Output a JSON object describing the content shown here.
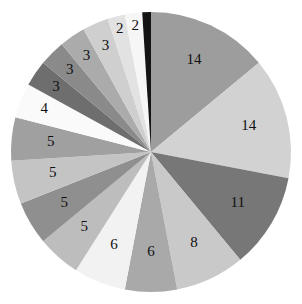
{
  "chart_data": {
    "type": "pie",
    "title": "",
    "subtitle": "",
    "xlabel": "",
    "ylabel": "",
    "legend": "none",
    "grid": false,
    "total": 100,
    "start_angle_deg": 0,
    "direction": "clockwise",
    "labels_shown_as": "value",
    "categories": [
      "14",
      "14",
      "11",
      "8",
      "6",
      "6",
      "5",
      "5",
      "5",
      "5",
      "4",
      "3",
      "3",
      "3",
      "3",
      "2",
      "2",
      "1"
    ],
    "values": [
      14,
      14,
      11,
      8,
      6,
      6,
      5,
      5,
      5,
      5,
      4,
      3,
      3,
      3,
      3,
      2,
      2,
      1
    ],
    "slice_labels": [
      "14",
      "14",
      "11",
      "8",
      "6",
      "6",
      "5",
      "5",
      "5",
      "5",
      "4",
      "3",
      "3",
      "3",
      "3",
      "2",
      "2",
      "1"
    ],
    "colors": [
      "#9d9d9d",
      "#d2d2d2",
      "#777777",
      "#c9c9c9",
      "#a9a9a9",
      "#f2f2f2",
      "#bdbdbd",
      "#8f8f8f",
      "#c4c4c4",
      "#a0a0a0",
      "#fafafa",
      "#6e6e6e",
      "#8a8a8a",
      "#ababab",
      "#cfcfcf",
      "#e2e2e2",
      "#f6f6f6",
      "#141414"
    ],
    "geometry": {
      "cx": 151,
      "cy": 152,
      "r": 140,
      "label_radius_ratio": 0.72
    }
  },
  "canvas": {
    "width": 302,
    "height": 304,
    "background": "#ffffff"
  }
}
